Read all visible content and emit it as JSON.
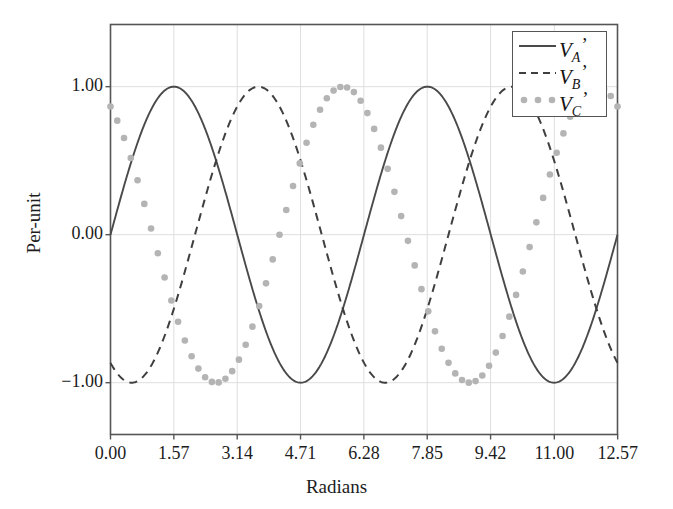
{
  "chart_data": {
    "type": "line",
    "title": "",
    "xlabel": "Radians",
    "ylabel": "Per-unit",
    "xlim": [
      0.0,
      12.566
    ],
    "ylim": [
      -1.35,
      1.42
    ],
    "grid": true,
    "legend_position": "top-right",
    "xticks": [
      "0.00",
      "1.57",
      "3.14",
      "4.71",
      "6.28",
      "7.85",
      "9.42",
      "11.00",
      "12.57"
    ],
    "xtick_values": [
      0.0,
      1.57,
      3.14,
      4.71,
      6.28,
      7.85,
      9.42,
      11.0,
      12.57
    ],
    "yticks": [
      "1.00",
      "0.00",
      "−1.00"
    ],
    "ytick_values": [
      1.0,
      0.0,
      -1.0
    ],
    "series": [
      {
        "name": "V_A'",
        "label_base": "V",
        "label_sub": "A",
        "label_prime": "’",
        "style": "solid",
        "color": "#4a4a4a",
        "amplitude": 1.0,
        "phase_rad": 0.0,
        "formula": "sin(x)",
        "key_points": [
          {
            "x": 0.0,
            "y": 0.0
          },
          {
            "x": 1.57,
            "y": 1.0
          },
          {
            "x": 3.14,
            "y": 0.0
          },
          {
            "x": 4.71,
            "y": -1.0
          },
          {
            "x": 6.28,
            "y": 0.0
          },
          {
            "x": 7.85,
            "y": 1.0
          },
          {
            "x": 9.42,
            "y": 0.0
          },
          {
            "x": 11.0,
            "y": -1.0
          },
          {
            "x": 12.57,
            "y": 0.0
          }
        ]
      },
      {
        "name": "V_B'",
        "label_base": "V",
        "label_sub": "B",
        "label_prime": "’",
        "style": "dashed",
        "color": "#3f3f3f",
        "amplitude": 1.0,
        "phase_rad": -2.0944,
        "formula": "sin(x − 2π/3)",
        "key_points": [
          {
            "x": 0.0,
            "y": -0.866
          },
          {
            "x": 0.52,
            "y": -1.0
          },
          {
            "x": 2.09,
            "y": 0.0
          },
          {
            "x": 3.67,
            "y": 1.0
          },
          {
            "x": 5.24,
            "y": 0.0
          },
          {
            "x": 6.81,
            "y": -1.0
          },
          {
            "x": 8.38,
            "y": 0.0
          },
          {
            "x": 9.95,
            "y": 1.0
          },
          {
            "x": 11.52,
            "y": 0.0
          },
          {
            "x": 12.57,
            "y": 0.866
          }
        ]
      },
      {
        "name": "V_C'",
        "label_base": "V",
        "label_sub": "C",
        "label_prime": "’",
        "style": "dotted",
        "color": "#b4b4b4",
        "amplitude": 1.0,
        "phase_rad": 2.0944,
        "formula": "sin(x + 2π/3)",
        "key_points": [
          {
            "x": 0.0,
            "y": 0.866
          },
          {
            "x": 1.05,
            "y": 0.0
          },
          {
            "x": 2.62,
            "y": -1.0
          },
          {
            "x": 4.19,
            "y": 0.0
          },
          {
            "x": 5.76,
            "y": 1.0
          },
          {
            "x": 7.33,
            "y": 0.0
          },
          {
            "x": 8.9,
            "y": -1.0
          },
          {
            "x": 10.47,
            "y": 0.0
          },
          {
            "x": 12.04,
            "y": 1.0
          },
          {
            "x": 12.57,
            "y": 0.866
          }
        ]
      }
    ]
  },
  "legend": {
    "items": [
      {
        "base": "V",
        "sub": "A",
        "prime": "’"
      },
      {
        "base": "V",
        "sub": "B",
        "prime": "’"
      },
      {
        "base": "V",
        "sub": "C",
        "prime": "’"
      }
    ]
  },
  "colors": {
    "frame": "#555555",
    "grid": "#dedede",
    "series_a": "#4a4a4a",
    "series_b": "#3f3f3f",
    "series_c": "#b4b4b4",
    "background": "#ffffff",
    "text": "#1a1a1a"
  }
}
